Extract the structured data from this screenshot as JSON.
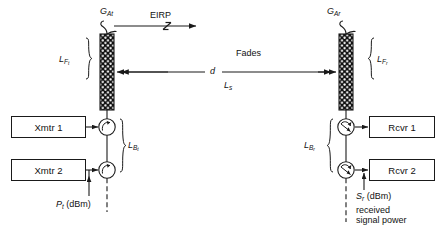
{
  "figure": {
    "type": "rf-link-budget-block-diagram"
  },
  "labels": {
    "gain_tx": {
      "base": "G",
      "sub": "At"
    },
    "gain_rx": {
      "base": "G",
      "sub": "Ar"
    },
    "eirp": "EIRP",
    "feeder_loss_tx": {
      "base": "L",
      "sub": "F",
      "sub2": "t"
    },
    "feeder_loss_rx": {
      "base": "L",
      "sub": "F",
      "sub2": "r"
    },
    "branching_loss_tx": {
      "base": "L",
      "sub": "B",
      "sub2": "t"
    },
    "branching_loss_rx": {
      "base": "L",
      "sub": "B",
      "sub2": "r"
    },
    "fades": "Fades",
    "distance": "d",
    "path_loss": {
      "base": "L",
      "sub": "s"
    },
    "tx_power": {
      "base": "P",
      "sub": "t",
      "units": "(dBm)"
    },
    "rx_power": {
      "base": "S",
      "sub": "r",
      "units": "(dBm)"
    },
    "rx_power_line2": "received",
    "rx_power_line3": "signal power"
  },
  "blocks": {
    "xmtr1": "Xmtr 1",
    "xmtr2": "Xmtr 2",
    "rcvr1": "Rcvr 1",
    "rcvr2": "Rcvr 2"
  },
  "colors": {
    "stroke": "#1a1a1a",
    "background": "#ffffff",
    "text": "#111111"
  }
}
